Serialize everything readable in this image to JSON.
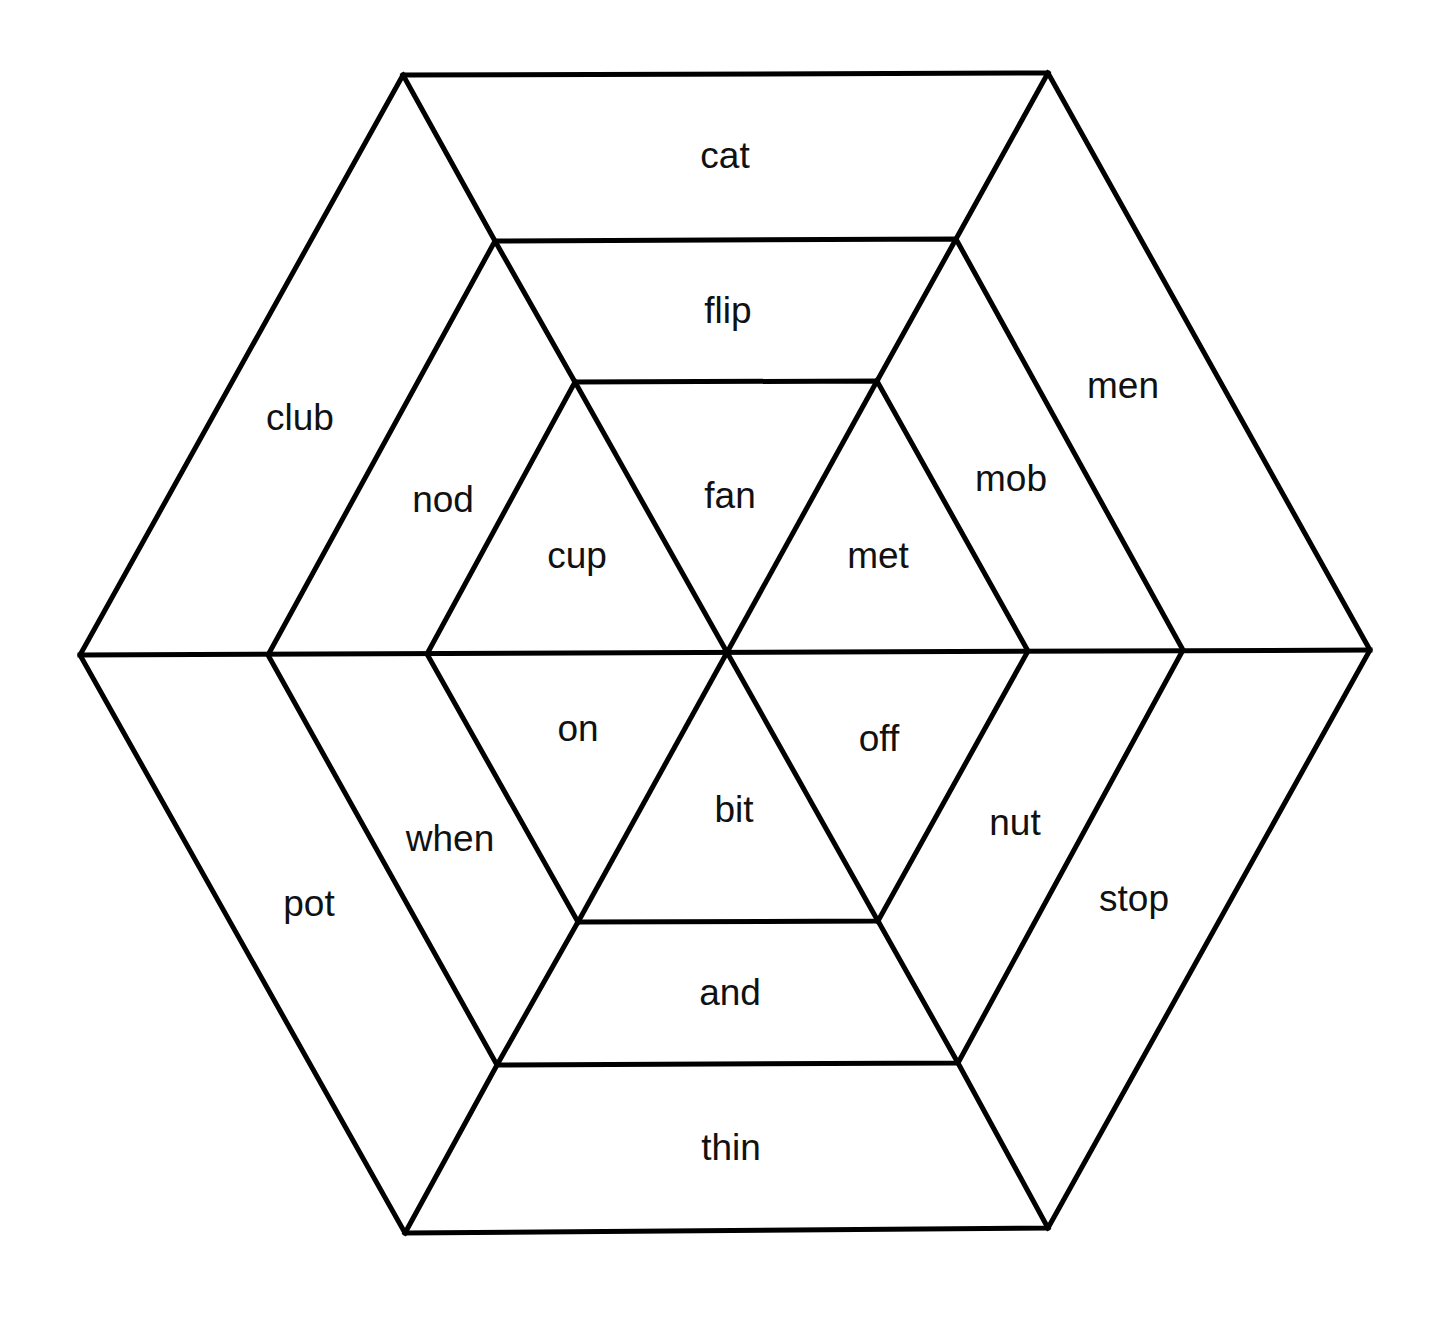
{
  "diagram": {
    "type": "hexagonal word web",
    "colors": {
      "line": "#000000",
      "text": "#111111",
      "background": "#ffffff"
    },
    "words": [
      {
        "id": "cat",
        "ring": "outer",
        "label": "cat",
        "x": 725,
        "y": 155
      },
      {
        "id": "men",
        "ring": "outer",
        "label": "men",
        "x": 1123,
        "y": 385
      },
      {
        "id": "stop",
        "ring": "outer",
        "label": "stop",
        "x": 1134,
        "y": 898
      },
      {
        "id": "thin",
        "ring": "outer",
        "label": "thin",
        "x": 731,
        "y": 1147
      },
      {
        "id": "pot",
        "ring": "outer",
        "label": "pot",
        "x": 309,
        "y": 903
      },
      {
        "id": "club",
        "ring": "outer",
        "label": "club",
        "x": 300,
        "y": 417
      },
      {
        "id": "flip",
        "ring": "middle",
        "label": "flip",
        "x": 728,
        "y": 310
      },
      {
        "id": "mob",
        "ring": "middle",
        "label": "mob",
        "x": 1011,
        "y": 478
      },
      {
        "id": "nut",
        "ring": "middle",
        "label": "nut",
        "x": 1015,
        "y": 822
      },
      {
        "id": "and",
        "ring": "middle",
        "label": "and",
        "x": 730,
        "y": 992
      },
      {
        "id": "when",
        "ring": "middle",
        "label": "when",
        "x": 450,
        "y": 838
      },
      {
        "id": "nod",
        "ring": "middle",
        "label": "nod",
        "x": 443,
        "y": 499
      },
      {
        "id": "fan",
        "ring": "inner",
        "label": "fan",
        "x": 730,
        "y": 495
      },
      {
        "id": "met",
        "ring": "inner",
        "label": "met",
        "x": 878,
        "y": 555
      },
      {
        "id": "off",
        "ring": "inner",
        "label": "off",
        "x": 879,
        "y": 738
      },
      {
        "id": "bit",
        "ring": "inner",
        "label": "bit",
        "x": 734,
        "y": 809
      },
      {
        "id": "on",
        "ring": "inner",
        "label": "on",
        "x": 578,
        "y": 728
      },
      {
        "id": "cup",
        "ring": "inner",
        "label": "cup",
        "x": 577,
        "y": 555
      }
    ]
  }
}
